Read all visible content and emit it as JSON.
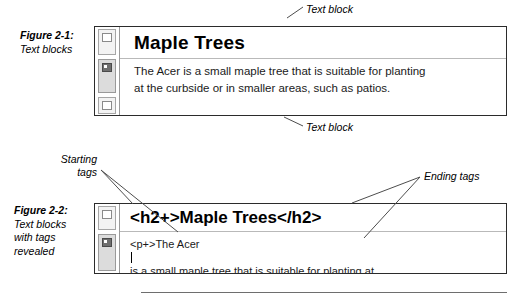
{
  "page": {
    "background": "#ffffff",
    "width": 514,
    "height": 303
  },
  "figures": [
    {
      "id": "fig-2-1",
      "caption_number": "Figure 2-1:",
      "caption_lines": [
        "Text blocks"
      ],
      "editor": {
        "heading": "Maple Trees",
        "paragraph_lines": [
          "The Acer is a small maple tree that is suitable for planting",
          "at the curbside or in smaller areas, such as patios."
        ],
        "gutter_markers": [
          "paragraph-marker",
          "heading-marker",
          "paragraph-marker"
        ]
      },
      "annotations": [
        {
          "label": "Text block",
          "target": "heading-block"
        },
        {
          "label": "Text block",
          "target": "paragraph-block"
        }
      ]
    },
    {
      "id": "fig-2-2",
      "caption_number": "Figure 2-2:",
      "caption_lines": [
        "Text blocks",
        "with tags",
        "revealed"
      ],
      "editor": {
        "heading": "<h2+>Maple Trees</h2>",
        "paragraph_lines": [
          "<p+>The Acer is a small maple tree that is suitable for planting at",
          "the curbside or in smaller areas, such as patios.</p>"
        ],
        "caret_after": "<p+>The Acer ",
        "gutter_markers": [
          "paragraph-marker",
          "heading-marker"
        ]
      },
      "annotations": [
        {
          "label": "Starting\ntags",
          "target": "opening-tags"
        },
        {
          "label": "Ending tags",
          "target": "closing-tags"
        }
      ]
    }
  ],
  "colors": {
    "text": "#000000",
    "border": "#2b2b2b",
    "gutter_border": "#9a9a9a",
    "gutter_fill": "#dcdcdc",
    "rule": "#6e6e6e",
    "leader": "#4d4d4d"
  }
}
